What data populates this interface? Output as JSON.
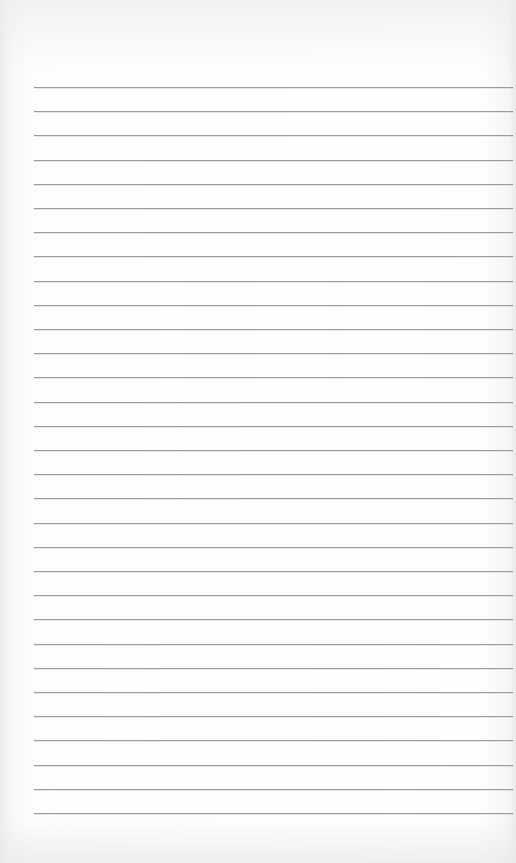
{
  "page": {
    "type": "lined-paper",
    "background_color": "#fbfbfb",
    "line_color": "#9c9c9c",
    "line_count": 31,
    "first_line_y": 87,
    "last_line_y": 813,
    "line_left_x": 34,
    "line_right_x": 513
  }
}
